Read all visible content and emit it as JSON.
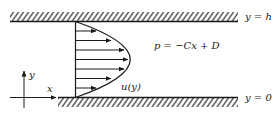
{
  "diagram": {
    "type": "channel-flow",
    "walls": {
      "top": {
        "label": "y = h"
      },
      "bottom": {
        "label": "y = 0"
      }
    },
    "equation": "p = −Cx + D",
    "profile_label": "u(y)",
    "axes": {
      "x_label": "x",
      "y_label": "y"
    },
    "profile_arrow_count": 7,
    "colors": {
      "ink": "#1a1a1a",
      "background": "#ffffff"
    }
  }
}
